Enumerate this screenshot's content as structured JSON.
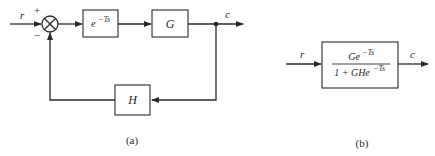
{
  "diagram_a": {
    "caption": "(a)",
    "input_label": "r",
    "output_label": "c",
    "sum_plus_sign": "+",
    "sum_minus_sign": "−",
    "delay_block": {
      "base": "e",
      "exponent": "−Ts"
    },
    "plant_block": {
      "label": "G"
    },
    "feedback_block": {
      "label": "H"
    }
  },
  "diagram_b": {
    "caption": "(b)",
    "input_label": "r",
    "output_label": "c",
    "transfer_block": {
      "numerator_base": "Ge",
      "numerator_exponent": "−Ts",
      "denominator_base": "1 + GHe",
      "denominator_exponent": "−Ts"
    }
  }
}
